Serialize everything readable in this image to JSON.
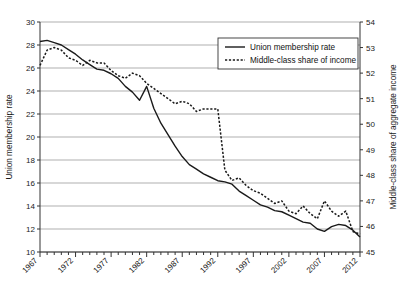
{
  "chart_data": {
    "type": "line",
    "title": "",
    "xlabel": "",
    "x": [
      1967,
      1968,
      1969,
      1970,
      1971,
      1972,
      1973,
      1974,
      1975,
      1976,
      1977,
      1978,
      1979,
      1980,
      1981,
      1982,
      1983,
      1984,
      1985,
      1986,
      1987,
      1988,
      1989,
      1990,
      1991,
      1992,
      1993,
      1994,
      1995,
      1996,
      1997,
      1998,
      1999,
      2000,
      2001,
      2002,
      2003,
      2004,
      2005,
      2006,
      2007,
      2008,
      2009,
      2010,
      2011,
      2012
    ],
    "xtick_labels": [
      "1967",
      "1972",
      "1977",
      "1982",
      "1987",
      "1992",
      "1997",
      "2002",
      "2007",
      "2012"
    ],
    "xtick_values": [
      1967,
      1972,
      1977,
      1982,
      1987,
      1992,
      1997,
      2002,
      2007,
      2012
    ],
    "xlim": [
      1967,
      2012
    ],
    "grid": true,
    "legend_position": "top-right",
    "left_axis": {
      "label": "Union membership rate",
      "ylim": [
        10,
        30
      ],
      "ticks": [
        10,
        12,
        14,
        16,
        18,
        20,
        22,
        24,
        26,
        28,
        30
      ]
    },
    "right_axis": {
      "label": "Middle-class share of aggregate income",
      "ylim": [
        45,
        54
      ],
      "ticks": [
        45,
        46,
        47,
        48,
        49,
        50,
        51,
        52,
        53,
        54
      ]
    },
    "series": [
      {
        "name": "Union membership rate",
        "axis": "left",
        "style": "solid",
        "color": "#1a1a1a",
        "values": [
          28.3,
          28.4,
          28.2,
          28.0,
          27.6,
          27.2,
          26.7,
          26.3,
          25.9,
          25.8,
          25.5,
          25.1,
          24.4,
          23.9,
          23.2,
          24.4,
          22.5,
          21.2,
          20.2,
          19.2,
          18.3,
          17.6,
          17.2,
          16.8,
          16.5,
          16.2,
          16.1,
          15.9,
          15.3,
          14.9,
          14.5,
          14.1,
          13.9,
          13.6,
          13.5,
          13.2,
          12.9,
          12.6,
          12.5,
          12.0,
          11.8,
          12.2,
          12.4,
          12.3,
          11.9,
          11.3
        ]
      },
      {
        "name": "Middle-class share of income",
        "axis": "right",
        "style": "dotted",
        "color": "#1a1a1a",
        "values": [
          52.3,
          52.9,
          53.0,
          52.9,
          52.6,
          52.5,
          52.3,
          52.5,
          52.4,
          52.4,
          52.1,
          51.9,
          51.8,
          52.0,
          51.9,
          51.6,
          51.4,
          51.2,
          51.0,
          50.8,
          50.9,
          50.8,
          50.5,
          50.6,
          50.6,
          50.6,
          48.2,
          47.8,
          47.9,
          47.6,
          47.4,
          47.3,
          47.1,
          46.9,
          47.0,
          46.6,
          46.5,
          46.8,
          46.5,
          46.3,
          47.0,
          46.6,
          46.4,
          46.6,
          45.8,
          45.7
        ]
      }
    ]
  },
  "legend": {
    "items": [
      {
        "label": "Union membership rate",
        "style": "solid"
      },
      {
        "label": "Middle-class share of income",
        "style": "dotted"
      }
    ]
  }
}
